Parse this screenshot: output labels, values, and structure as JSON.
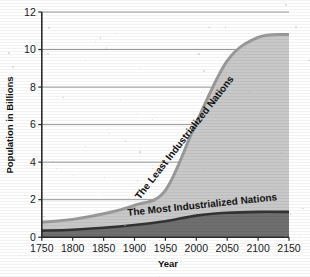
{
  "chart_data": {
    "type": "area",
    "title": "",
    "xlabel": "Year",
    "ylabel": "Population in Billions",
    "xlim": [
      1750,
      2150
    ],
    "ylim": [
      0,
      12
    ],
    "grid": true,
    "legend_position": "inline-annotations",
    "xticks": [
      "1750",
      "1800",
      "1850",
      "1900",
      "1950",
      "2000",
      "2050",
      "2100",
      "2150"
    ],
    "yticks": [
      "0",
      "2",
      "4",
      "6",
      "8",
      "10",
      "12"
    ],
    "x": [
      1750,
      1800,
      1850,
      1900,
      1950,
      2000,
      2050,
      2100,
      2150
    ],
    "series": [
      {
        "name": "The Most Industrialized Nations",
        "values": [
          0.35,
          0.4,
          0.5,
          0.65,
          0.85,
          1.15,
          1.3,
          1.35,
          1.35
        ],
        "color": "#6f6f6f",
        "line_color": "#333333"
      },
      {
        "name": "The Least Industrialized Nations",
        "values": [
          0.45,
          0.55,
          0.75,
          1.05,
          1.65,
          4.95,
          8.1,
          9.3,
          9.45
        ],
        "color": "#c8c8c8",
        "line_color": "#9a9a9a"
      }
    ],
    "stacked_totals": [
      0.8,
      0.95,
      1.25,
      1.7,
      2.5,
      6.1,
      9.4,
      10.65,
      10.8
    ],
    "annotations": [
      {
        "text": "The Least Industrialized Nations",
        "x": 1985,
        "y": 5.2
      },
      {
        "text": "The Most Industrialized Nations",
        "x": 2010,
        "y": 1.55
      }
    ]
  },
  "colors": {
    "background": "#ffffff",
    "grid": "#8c8c8c",
    "axis": "#2b2b2b",
    "upper_fill": "#c8c8c8",
    "upper_edge": "#9a9a9a",
    "lower_fill": "#6f6f6f",
    "lower_edge": "#2f2f2f",
    "text": "#111111"
  }
}
